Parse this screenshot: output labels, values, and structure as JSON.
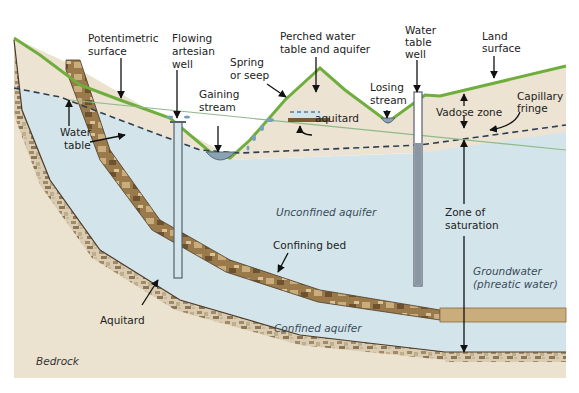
{
  "diagram": {
    "colors": {
      "background": "#ffffff",
      "sediment": "#ece3d2",
      "bedrock": "#ebe2d0",
      "water": "#d3e5ea",
      "grass": "#6fae3c",
      "confining_bed": "#9a7a4a",
      "aquitard_rubble": "#a08a68",
      "water_table_dash": "#2c3e55",
      "potentiometric_line": "#8fb98a",
      "well_casing": "#7e8a94",
      "stream_water": "#8aa2b4",
      "label_text": "#222222",
      "italic_label_text": "#3a4a5a"
    },
    "labels": {
      "potentiometric_surface_1": "Potentimetric",
      "potentiometric_surface_2": "surface",
      "flowing_artesian_1": "Flowing",
      "flowing_artesian_2": "artesian",
      "flowing_artesian_3": "well",
      "perched_1": "Perched water",
      "perched_2": "table and aquifer",
      "water_table_well_1": "Water",
      "water_table_well_2": "table",
      "water_table_well_3": "well",
      "land_surface_1": "Land",
      "land_surface_2": "surface",
      "spring_1": "Spring",
      "spring_2": "or seep",
      "gaining_1": "Gaining",
      "gaining_2": "stream",
      "losing_1": "Losing",
      "losing_2": "stream",
      "aquitard_perched": "aquitard",
      "vadose_zone": "Vadose zone",
      "capillary_1": "Capillary",
      "capillary_2": "fringe",
      "water_table_1": "Water",
      "water_table_2": "table",
      "unconfined_aquifer": "Unconfined aquifer",
      "zone_sat_1": "Zone of",
      "zone_sat_2": "saturation",
      "confining_bed": "Confining bed",
      "groundwater_1": "Groundwater",
      "groundwater_2": "(phreatic water)",
      "aquitard": "Aquitard",
      "confined_aquifer": "Confined aquifer",
      "bedrock": "Bedrock"
    }
  }
}
